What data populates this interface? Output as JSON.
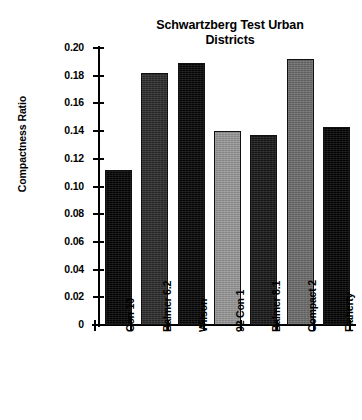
{
  "chart_data": {
    "type": "bar",
    "title": "Schwartzberg Test Urban Districts",
    "title_line1": "Schwartzberg Test Urban",
    "title_line2": "Districts",
    "xlabel": "",
    "ylabel": "Compactness Ratio",
    "ylim": [
      0,
      0.2
    ],
    "grid": false,
    "legend": "none",
    "categories": [
      "Con 10",
      "Balmer 6.2",
      "Wilson",
      "92 Con 1",
      "Balmer 8.1",
      "Compact 2",
      "Flaherty"
    ],
    "values": [
      0.112,
      0.182,
      0.189,
      0.14,
      0.137,
      0.192,
      0.143
    ],
    "bar_colors": [
      "#050505",
      "#2e2e2e",
      "#080808",
      "#9a9a9a",
      "#1a1a1a",
      "#6e6e6e",
      "#050505"
    ],
    "ytick_labels": [
      "0.20",
      "0.18",
      "0.16",
      "0.14",
      "0.12",
      "0.10",
      "0.08",
      "0.06",
      "0.04",
      "0.02",
      "0"
    ],
    "ytick_values": [
      0.2,
      0.18,
      0.16,
      0.14,
      0.12,
      0.1,
      0.08,
      0.06,
      0.04,
      0.02,
      0
    ]
  }
}
